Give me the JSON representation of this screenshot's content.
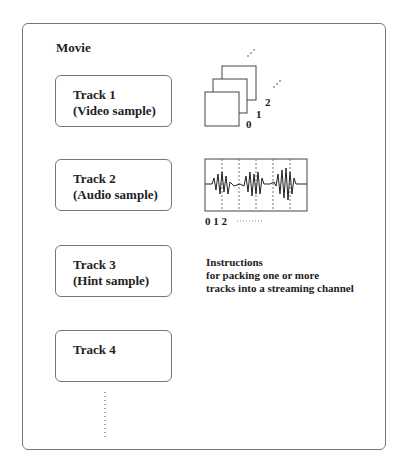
{
  "diagram": {
    "container_label": "Movie",
    "tracks": [
      {
        "line1": "Track 1",
        "line2": "(Video sample)"
      },
      {
        "line1": "Track 2",
        "line2": "(Audio sample)"
      },
      {
        "line1": "Track 3",
        "line2": "(Hint sample)"
      },
      {
        "line1": "Track 4",
        "line2": ""
      }
    ],
    "video_frame_labels": [
      "0",
      "1",
      "2"
    ],
    "audio_sample_labels": "0 1 2",
    "hint_description": [
      "Instructions",
      "for packing one or more",
      "tracks into a streaming channel"
    ]
  }
}
